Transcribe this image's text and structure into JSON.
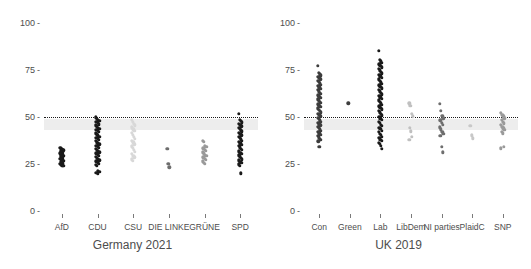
{
  "chart_data": [
    {
      "type": "scatter",
      "title": "Germany 2021",
      "xlabel": "Germany 2021",
      "ylabel": "",
      "ylim": [
        0,
        100
      ],
      "yticks": [
        0,
        25,
        50,
        75,
        100
      ],
      "ytick_labels": [
        "0",
        "25",
        "50",
        "75",
        "100"
      ],
      "grid": false,
      "legend": "none",
      "threshold": 50,
      "threshold_style": "dotted",
      "band": {
        "low": 43,
        "high": 49,
        "color": "#eaeaea"
      },
      "categories": [
        "AfD",
        "CDU",
        "CSU",
        "DIE LINKE",
        "GRÜNE",
        "SPD"
      ],
      "series": [
        {
          "name": "AfD",
          "color": "#1a1a1a",
          "values": [
            33.5,
            33,
            32.6,
            32.2,
            31.8,
            31.4,
            31,
            30.6,
            30.2,
            29.8,
            29.4,
            29,
            28.6,
            28.2,
            27.8,
            27.4,
            27,
            26.6,
            26.2,
            25.8,
            25.4,
            25,
            24.6,
            24.2,
            23.9
          ]
        },
        {
          "name": "CDU",
          "color": "#1a1a1a",
          "values": [
            49.8,
            49.2,
            48.6,
            48,
            47.4,
            46.8,
            46.2,
            45.6,
            45,
            44.4,
            43.8,
            43.2,
            42.6,
            42,
            41.4,
            40.8,
            40.2,
            39.6,
            39,
            38.4,
            37.8,
            37.2,
            36.6,
            36,
            35.4,
            34.8,
            34.2,
            33.6,
            33,
            32.4,
            31.8,
            31.2,
            30.6,
            30,
            29.4,
            28.8,
            28.2,
            27.6,
            27,
            26.4,
            25.8,
            25.2,
            24.6,
            24,
            21.5,
            21,
            20.4,
            19.9
          ]
        },
        {
          "name": "CSU",
          "color": "#d8d8d8",
          "values": [
            48.5,
            47.5,
            46.5,
            45.5,
            44.5,
            43.5,
            42.5,
            41.5,
            40.5,
            39.5,
            38.5,
            37.5,
            36.5,
            35.5,
            34.5,
            33.5,
            32.5,
            31.5,
            30.5,
            29.5,
            28.5,
            27.5,
            26.8
          ]
        },
        {
          "name": "DIE LINKE",
          "color": "#6e6e6e",
          "values": [
            33.2,
            25.2,
            23.3
          ]
        },
        {
          "name": "GRÜNE",
          "color": "#9a9a9a",
          "values": [
            37.5,
            36.8,
            34.8,
            34.1,
            33.4,
            32.7,
            32,
            31.3,
            30.6,
            29.9,
            29.2,
            28.5,
            27.8,
            27.1,
            26.4,
            25.7,
            25
          ]
        },
        {
          "name": "SPD",
          "color": "#1a1a1a",
          "values": [
            51.8,
            48.6,
            47.9,
            47.2,
            46.5,
            45.8,
            45.1,
            44.4,
            43.7,
            43,
            42.3,
            41.6,
            40.9,
            40.2,
            39.5,
            38.8,
            38.1,
            37.4,
            36.7,
            36,
            35.3,
            34.6,
            33.9,
            33.2,
            32.5,
            31.8,
            31.1,
            30.4,
            29.7,
            29,
            28.3,
            27.6,
            26.9,
            26.2,
            25.5,
            24.8,
            24.1,
            20.1
          ]
        }
      ]
    },
    {
      "type": "scatter",
      "title": "UK 2019",
      "xlabel": "UK 2019",
      "ylabel": "",
      "ylim": [
        0,
        100
      ],
      "yticks": [
        0,
        25,
        50,
        75,
        100
      ],
      "ytick_labels": [
        "0",
        "25",
        "50",
        "75",
        "100"
      ],
      "grid": false,
      "legend": "none",
      "threshold": 50,
      "threshold_style": "dotted",
      "band": {
        "low": 43,
        "high": 49,
        "color": "#eaeaea"
      },
      "categories": [
        "Con",
        "Green",
        "Lab",
        "LibDem",
        "NI parties",
        "PlaidC",
        "SNP"
      ],
      "series": [
        {
          "name": "Con",
          "color": "#3d3d3d",
          "values": [
            77.1,
            73.5,
            72.8,
            72.1,
            71.4,
            70.7,
            70,
            69.3,
            68.6,
            67.9,
            67.2,
            66.5,
            65.8,
            65.1,
            64.4,
            63.7,
            63,
            62.3,
            61.6,
            60.9,
            60.2,
            59.5,
            58.8,
            58.1,
            57.4,
            56.7,
            56,
            55.3,
            54.6,
            53.9,
            53.2,
            52.5,
            51.8,
            51.1,
            50.4,
            49.7,
            49,
            48.3,
            47.6,
            46.9,
            46.2,
            45.5,
            44.8,
            44.1,
            43.4,
            42.7,
            42,
            41.3,
            40.6,
            39.9,
            39.2,
            38.5,
            37.8,
            37.1,
            34.3
          ]
        },
        {
          "name": "Green",
          "color": "#3d3d3d",
          "values": [
            57.2
          ]
        },
        {
          "name": "Lab",
          "color": "#1a1a1a",
          "values": [
            85.2,
            80.4,
            79.6,
            78.8,
            78,
            77.2,
            76.4,
            75.6,
            74.8,
            74,
            73.2,
            72.4,
            71.6,
            70.8,
            70,
            69.2,
            68.4,
            67.6,
            66.8,
            66,
            65.2,
            64.4,
            63.6,
            62.8,
            62,
            61.2,
            60.4,
            59.6,
            58.8,
            58,
            57.2,
            56.4,
            55.6,
            54.8,
            54,
            53.2,
            52.4,
            51.6,
            50.8,
            50,
            49.2,
            48.4,
            47.6,
            46.8,
            46,
            45.2,
            44.4,
            43.6,
            42.8,
            42,
            41.2,
            40.4,
            39.6,
            38.8,
            38,
            37.2,
            36.4,
            35.6,
            34.8,
            33.2
          ]
        },
        {
          "name": "LibDem",
          "color": "#c0c0c0",
          "values": [
            57.3,
            55.8,
            51.6,
            50.4,
            44.3,
            42.4,
            39.6,
            37.8
          ]
        },
        {
          "name": "NI parties",
          "color": "#6e6e6e",
          "values": [
            57.1,
            53.4,
            50.6,
            49.4,
            48.2,
            47,
            45.8,
            44.6,
            43.4,
            42.2,
            41,
            39.9,
            34.2,
            31.3
          ]
        },
        {
          "name": "PlaidC",
          "color": "#c8c8c8",
          "values": [
            45.2,
            40.3,
            38.6
          ]
        },
        {
          "name": "SNP",
          "color": "#9a9a9a",
          "values": [
            52.1,
            51.2,
            50.3,
            49.4,
            48.5,
            47.6,
            46.7,
            45.8,
            44.9,
            44,
            43.1,
            42.2,
            41.3,
            34.1,
            33.4
          ]
        }
      ]
    }
  ]
}
